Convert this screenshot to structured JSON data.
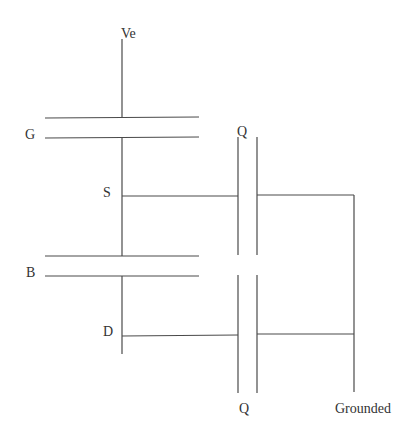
{
  "diagram": {
    "type": "circuit-schematic",
    "labels": {
      "ve": "Ve",
      "g": "G",
      "s": "S",
      "b": "B",
      "d": "D",
      "q_top": "Q",
      "q_bottom": "Q",
      "grounded": "Grounded"
    },
    "colors": {
      "line": "#4a4a4a",
      "text": "#333333",
      "background": "#ffffff"
    }
  }
}
